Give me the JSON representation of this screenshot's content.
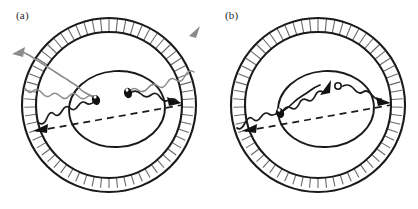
{
  "figure": {
    "type": "diagram",
    "background_color": "#ffffff",
    "panel_count": 2,
    "description_title": "",
    "stroke_color": "#1a1a1a",
    "wave_color_gray": "#8c8c8c",
    "wave_color_black": "#1a1a1a",
    "arrow_color_gray": "#8c8c8c",
    "arrow_color_black": "#111111"
  },
  "panels": [
    {
      "id": "a",
      "label": "(a)",
      "center": {
        "x": 109,
        "y": 105
      },
      "outer_shell": {
        "name": "outer-shell-annulus",
        "outer_radius": 87,
        "inner_radius": 73,
        "tick_count": 64,
        "tick_color": "#6a6a6a",
        "rim_color": "#1a1a1a"
      },
      "inner_ellipse": {
        "name": "inner-ellipse",
        "rx": 48,
        "ry": 38,
        "rotation_deg": -4,
        "stroke": "#1a1a1a"
      },
      "chord": {
        "name": "dashed-chord",
        "style": "dashed",
        "x1": 36,
        "y1": 131,
        "x2": 182,
        "y2": 105
      },
      "particles": [
        {
          "name": "particle-left",
          "x": 96,
          "y": 99,
          "fill": "#111111",
          "kind": "filled-blob"
        },
        {
          "name": "particle-right",
          "x": 128,
          "y": 93,
          "fill": "#111111",
          "kind": "filled-blob"
        }
      ],
      "black_arrowheads": [
        {
          "name": "arrowhead-lower-left",
          "x": 42,
          "y": 128,
          "direction": "left"
        },
        {
          "name": "arrowhead-right",
          "x": 172,
          "y": 101,
          "direction": "right"
        }
      ],
      "gray_arrowheads": [
        {
          "name": "gray-arrow-upper-left",
          "x": 16,
          "y": 52,
          "direction": "left-down"
        },
        {
          "name": "gray-arrow-upper-right",
          "x": 196,
          "y": 31,
          "direction": "right-up"
        }
      ],
      "wavy_rays_gray": 2,
      "wavy_rays_black": 2
    },
    {
      "id": "b",
      "label": "(b)",
      "center": {
        "x": 318,
        "y": 105
      },
      "outer_shell": {
        "name": "outer-shell-annulus",
        "outer_radius": 87,
        "inner_radius": 73,
        "tick_count": 64,
        "tick_color": "#6a6a6a",
        "rim_color": "#1a1a1a"
      },
      "inner_ellipse": {
        "name": "inner-ellipse",
        "rx": 48,
        "ry": 38,
        "rotation_deg": -4,
        "stroke": "#1a1a1a"
      },
      "chord": {
        "name": "dashed-chord",
        "style": "dashed",
        "x1": 245,
        "y1": 131,
        "x2": 391,
        "y2": 105
      },
      "particles": [
        {
          "name": "particle-left",
          "x": 280,
          "y": 112,
          "fill": "#111111",
          "kind": "filled-blob"
        },
        {
          "name": "particle-open-circle",
          "x": 338,
          "y": 86,
          "fill": "#ffffff",
          "kind": "open-circle"
        }
      ],
      "black_arrowheads": [
        {
          "name": "arrowhead-lower-left",
          "x": 251,
          "y": 128,
          "direction": "left"
        },
        {
          "name": "arrowhead-mid-path",
          "x": 325,
          "y": 89,
          "direction": "up-right"
        },
        {
          "name": "arrowhead-right",
          "x": 381,
          "y": 101,
          "direction": "right"
        }
      ],
      "gray_arrowheads": [],
      "wavy_rays_gray": 0,
      "wavy_rays_black": 2
    }
  ]
}
